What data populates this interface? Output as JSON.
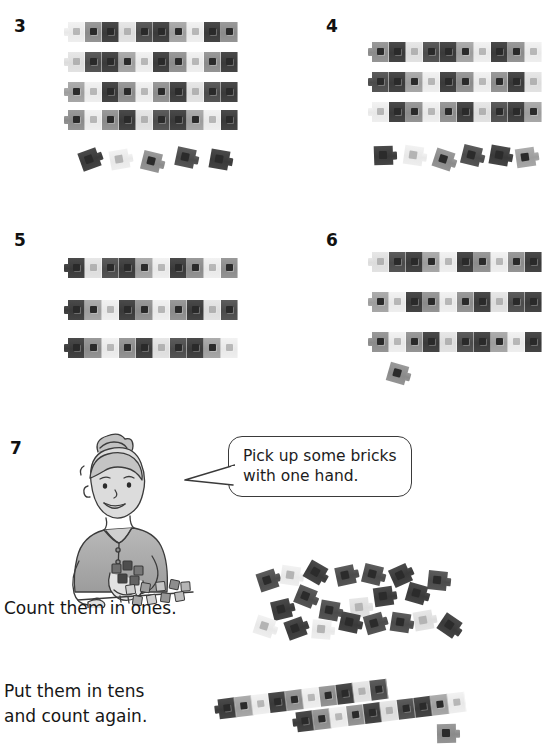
{
  "page": {
    "background": "#ffffff",
    "width": 548,
    "height": 756,
    "ink": "#1a1a1a"
  },
  "questions": [
    {
      "number": "3",
      "num_x": 14,
      "num_y": 18,
      "rods": [
        {
          "x": 68,
          "y": 22,
          "count": 10
        },
        {
          "x": 68,
          "y": 52,
          "count": 10
        },
        {
          "x": 68,
          "y": 82,
          "count": 10
        },
        {
          "x": 68,
          "y": 110,
          "count": 10
        }
      ],
      "loose": [
        {
          "x": 80,
          "y": 150,
          "shade": "s-dark"
        },
        {
          "x": 110,
          "y": 150,
          "shade": "s-light2",
          "light": true
        },
        {
          "x": 142,
          "y": 152,
          "shade": "s-mid"
        },
        {
          "x": 176,
          "y": 148,
          "shade": "s-dark2"
        },
        {
          "x": 210,
          "y": 150,
          "shade": "s-dark"
        }
      ],
      "total": 45
    },
    {
      "number": "4",
      "num_x": 326,
      "num_y": 18,
      "rods": [
        {
          "x": 372,
          "y": 42,
          "count": 10
        },
        {
          "x": 372,
          "y": 72,
          "count": 10
        },
        {
          "x": 372,
          "y": 102,
          "count": 10
        }
      ],
      "loose": [
        {
          "x": 374,
          "y": 146,
          "shade": "s-dark"
        },
        {
          "x": 404,
          "y": 146,
          "shade": "s-light2",
          "light": true
        },
        {
          "x": 434,
          "y": 150,
          "shade": "s-mid"
        },
        {
          "x": 462,
          "y": 146,
          "shade": "s-dark2"
        },
        {
          "x": 490,
          "y": 146,
          "shade": "s-dark"
        },
        {
          "x": 516,
          "y": 148,
          "shade": "s-mid2"
        }
      ],
      "total": 36
    },
    {
      "number": "5",
      "num_x": 14,
      "num_y": 232,
      "rods": [
        {
          "x": 68,
          "y": 258,
          "count": 10
        },
        {
          "x": 68,
          "y": 300,
          "count": 10
        },
        {
          "x": 68,
          "y": 338,
          "count": 10
        }
      ],
      "loose": [],
      "total": 30
    },
    {
      "number": "6",
      "num_x": 326,
      "num_y": 232,
      "rods": [
        {
          "x": 372,
          "y": 252,
          "count": 10
        },
        {
          "x": 372,
          "y": 292,
          "count": 10
        },
        {
          "x": 372,
          "y": 332,
          "count": 10
        }
      ],
      "loose": [
        {
          "x": 388,
          "y": 364,
          "shade": "s-mid"
        }
      ],
      "total": 31
    }
  ],
  "activity": {
    "number": "7",
    "num_x": 10,
    "num_y": 440,
    "speech_bubble": {
      "line1": "Pick up some bricks",
      "line2": "with one hand."
    },
    "instruction_ones": "Count them in ones.",
    "instruction_tens": "Put them in tens\nand count again.",
    "scattered_bricks": [
      {
        "x": 258,
        "y": 571,
        "shade": "s-dark2",
        "rot": -18
      },
      {
        "x": 281,
        "y": 566,
        "shade": "s-light2",
        "rot": 8,
        "light": true
      },
      {
        "x": 306,
        "y": 563,
        "shade": "s-dark",
        "rot": 30
      },
      {
        "x": 336,
        "y": 566,
        "shade": "s-dark2",
        "rot": -12
      },
      {
        "x": 363,
        "y": 565,
        "shade": "s-dark2",
        "rot": 14
      },
      {
        "x": 391,
        "y": 566,
        "shade": "s-dark",
        "rot": -24
      },
      {
        "x": 428,
        "y": 571,
        "shade": "s-dark2",
        "rot": 6
      },
      {
        "x": 296,
        "y": 587,
        "shade": "s-dark2",
        "rot": 22
      },
      {
        "x": 374,
        "y": 587,
        "shade": "s-dark",
        "rot": -8
      },
      {
        "x": 407,
        "y": 584,
        "shade": "s-dark",
        "rot": 16
      },
      {
        "x": 272,
        "y": 600,
        "shade": "s-dark",
        "rot": -14
      },
      {
        "x": 320,
        "y": 601,
        "shade": "s-dark2",
        "rot": 10
      },
      {
        "x": 350,
        "y": 598,
        "shade": "s-light",
        "rot": -6,
        "light": true
      },
      {
        "x": 255,
        "y": 617,
        "shade": "s-light2",
        "rot": 18,
        "light": true
      },
      {
        "x": 286,
        "y": 619,
        "shade": "s-dark",
        "rot": -20
      },
      {
        "x": 312,
        "y": 620,
        "shade": "s-light2",
        "rot": 5,
        "light": true
      },
      {
        "x": 340,
        "y": 613,
        "shade": "s-dark",
        "rot": 12
      },
      {
        "x": 365,
        "y": 614,
        "shade": "s-dark2",
        "rot": -16
      },
      {
        "x": 391,
        "y": 613,
        "shade": "s-dark2",
        "rot": 9
      },
      {
        "x": 414,
        "y": 611,
        "shade": "s-light",
        "rot": -10,
        "light": true
      },
      {
        "x": 440,
        "y": 616,
        "shade": "s-dark",
        "rot": 34
      }
    ],
    "tens_rods": [
      {
        "x": 218,
        "y": 689,
        "count": 10,
        "rot": -7
      },
      {
        "x": 296,
        "y": 702,
        "count": 10,
        "rot": -7
      }
    ],
    "extra_brick": {
      "x": 437,
      "y": 724,
      "shade": "s-mid"
    }
  },
  "illustration": {
    "name": "girl-counting-bricks",
    "x": 48,
    "y": 430,
    "width": 150,
    "height": 175
  }
}
